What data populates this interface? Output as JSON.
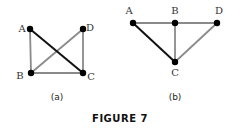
{
  "figure": {
    "caption": "FIGURE 7",
    "colors": {
      "dark_edge": "#111111",
      "light_edge": "#8a8a8a",
      "vertex": "#000000"
    },
    "graphs": [
      {
        "id": "a",
        "label": "(a)",
        "vertices": [
          {
            "name": "A",
            "x": 30,
            "y": 29,
            "lx": 22,
            "ly": 32
          },
          {
            "name": "D",
            "x": 83,
            "y": 29,
            "lx": 90,
            "ly": 31
          },
          {
            "name": "B",
            "x": 31,
            "y": 73,
            "lx": 20,
            "ly": 79
          },
          {
            "name": "C",
            "x": 83,
            "y": 73,
            "lx": 91,
            "ly": 80
          }
        ],
        "edges": [
          {
            "from": "A",
            "to": "C",
            "style": "dark"
          },
          {
            "from": "B",
            "to": "D",
            "style": "light"
          },
          {
            "from": "A",
            "to": "B",
            "style": "light"
          },
          {
            "from": "D",
            "to": "C",
            "style": "light"
          },
          {
            "from": "B",
            "to": "C",
            "style": "light"
          }
        ]
      },
      {
        "id": "b",
        "label": "(b)",
        "vertices": [
          {
            "name": "A",
            "x": 133,
            "y": 23,
            "lx": 129,
            "ly": 14
          },
          {
            "name": "B",
            "x": 175,
            "y": 23,
            "lx": 175,
            "ly": 14
          },
          {
            "name": "D",
            "x": 217,
            "y": 23,
            "lx": 219,
            "ly": 14
          },
          {
            "name": "C",
            "x": 175,
            "y": 62,
            "lx": 175,
            "ly": 76
          }
        ],
        "edges": [
          {
            "from": "A",
            "to": "C",
            "style": "dark"
          },
          {
            "from": "A",
            "to": "B",
            "style": "light"
          },
          {
            "from": "B",
            "to": "D",
            "style": "light"
          },
          {
            "from": "B",
            "to": "C",
            "style": "light"
          },
          {
            "from": "D",
            "to": "C",
            "style": "light"
          }
        ]
      }
    ]
  }
}
